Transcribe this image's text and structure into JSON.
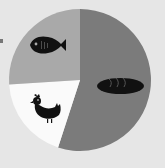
{
  "chart_data": {
    "type": "pie",
    "title": "",
    "categories": [
      "Bread",
      "Chicken",
      "Fish"
    ],
    "values": [
      55,
      19,
      26
    ],
    "unit": "%",
    "start_angle_deg": 0,
    "direction": "clockwise",
    "colors": [
      "#7b7b7b",
      "#fafafa",
      "#a9a9a9"
    ],
    "icons": [
      "bread-icon",
      "chicken-icon",
      "fish-icon"
    ],
    "legend": "none (slices labeled with pictogram icons)",
    "center": [
      80,
      80
    ],
    "radius": 71
  },
  "colors": {
    "background": "#e6e6e6",
    "icon": "#111111"
  }
}
